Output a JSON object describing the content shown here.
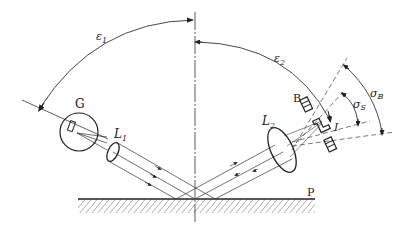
{
  "diagram": {
    "title_fragment": "",
    "labels": {
      "epsilon1": "ε",
      "epsilon1_sub": "1",
      "epsilon2": "ε",
      "epsilon2_sub": "2",
      "source": "G",
      "lens1": "L",
      "lens1_sub": "1",
      "lens2": "L",
      "lens2_sub": "2",
      "detector_b": "B",
      "detector_i": "I",
      "sigma_b": "σ",
      "sigma_b_sub": "B",
      "sigma_s": "σ",
      "sigma_s_sub": "S",
      "surface": "P"
    },
    "colors": {
      "line": "#222222",
      "dashed": "#555555",
      "background": "#ffffff"
    }
  }
}
